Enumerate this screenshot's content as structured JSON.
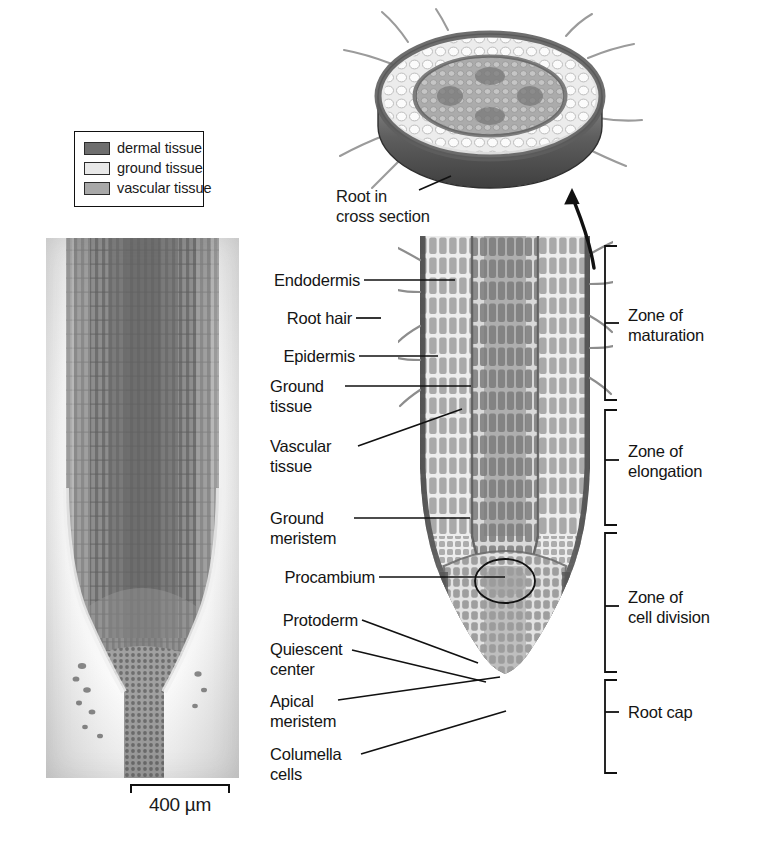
{
  "figure": {
    "kind": "root-anatomy-diagram",
    "background": "#ffffff"
  },
  "legend": {
    "items": [
      {
        "label": "dermal tissue",
        "color": "#6e6e6e",
        "swatch_name": "dermal-tissue-swatch"
      },
      {
        "label": "ground tissue",
        "color": "#e8e8e8",
        "swatch_name": "ground-tissue-swatch"
      },
      {
        "label": "vascular tissue",
        "color": "#a8a8a8",
        "swatch_name": "vascular-tissue-swatch"
      }
    ]
  },
  "micrograph": {
    "caption": "longitudinal section of root tip",
    "scalebar": {
      "label": "400 µm",
      "length_um": 400
    }
  },
  "cross_section": {
    "caption": "Root in\ncross section",
    "rim_color": "#6e6e6e",
    "ground_color": "#e0e0e0",
    "vascular_color": "#a8a8a8"
  },
  "labels": [
    {
      "id": "endodermis",
      "text": "Endodermis",
      "x": 262,
      "y": 272
    },
    {
      "id": "root-hair",
      "text": "Root hair",
      "x": 272,
      "y": 310
    },
    {
      "id": "epidermis",
      "text": "Epidermis",
      "x": 272,
      "y": 348
    },
    {
      "id": "ground-tissue",
      "text": "Ground\ntissue",
      "x": 279,
      "y": 377
    },
    {
      "id": "vascular-tissue",
      "text": "Vascular\ntissue",
      "x": 272,
      "y": 437
    },
    {
      "id": "ground-meristem",
      "text": "Ground\nmeristem",
      "x": 269,
      "y": 509
    },
    {
      "id": "procambium",
      "text": "Procambium",
      "x": 269,
      "y": 568
    },
    {
      "id": "protoderm",
      "text": "Protoderm",
      "x": 272,
      "y": 611
    },
    {
      "id": "quiescent-center",
      "text": "Quiescent\ncenter",
      "x": 269,
      "y": 640
    },
    {
      "id": "apical-meristem",
      "text": "Apical\nmeristem",
      "x": 279,
      "y": 692
    },
    {
      "id": "columella-cells",
      "text": "Columella\ncells",
      "x": 272,
      "y": 745
    }
  ],
  "zones": [
    {
      "id": "zone-of-maturation",
      "text": "Zone of\nmaturation",
      "x": 628,
      "y": 306,
      "bracket_top": 246,
      "bracket_bottom": 400
    },
    {
      "id": "zone-of-elongation",
      "text": "Zone of\nelongation",
      "x": 628,
      "y": 440,
      "bracket_top": 410,
      "bracket_bottom": 525
    },
    {
      "id": "zone-of-cell-division",
      "text": "Zone of\ncell division",
      "x": 628,
      "y": 595,
      "bracket_top": 533,
      "bracket_bottom": 672
    },
    {
      "id": "root-cap",
      "text": "Root cap",
      "x": 628,
      "y": 700,
      "bracket_top": 680,
      "bracket_bottom": 773
    }
  ]
}
